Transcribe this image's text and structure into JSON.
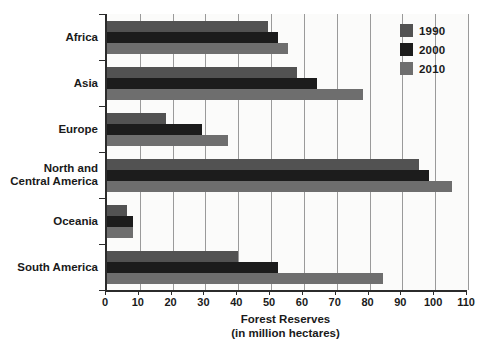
{
  "chart_data": {
    "type": "bar",
    "orientation": "horizontal",
    "title": "",
    "xlabel": "Forest Reserves (in million hectares)",
    "xlabel_line1": "Forest Reserves",
    "xlabel_line2": "(in million hectares)",
    "ylabel": "",
    "xlim": [
      0,
      110
    ],
    "xticks": [
      0,
      10,
      20,
      30,
      40,
      50,
      60,
      70,
      80,
      90,
      100,
      110
    ],
    "xtick_labels": [
      "0",
      "10",
      "20",
      "30",
      "40",
      "50",
      "60",
      "70",
      "80",
      "90",
      "100",
      "110"
    ],
    "grid": "vertical",
    "legend_position": "top-right",
    "categories": [
      "Africa",
      "Asia",
      "Europe",
      "North and Central America",
      "Oceania",
      "South America"
    ],
    "category_labels_wrapped": [
      [
        "Africa"
      ],
      [
        "Asia"
      ],
      [
        "Europe"
      ],
      [
        "North and",
        "Central America"
      ],
      [
        "Oceania"
      ],
      [
        "South America"
      ]
    ],
    "series": [
      {
        "name": "1990",
        "color": "#525252",
        "values": [
          49,
          58,
          18,
          95,
          6,
          40
        ]
      },
      {
        "name": "2000",
        "color": "#1c1c1c",
        "values": [
          52,
          64,
          29,
          98,
          8,
          52
        ]
      },
      {
        "name": "2010",
        "color": "#6e6e6e",
        "values": [
          55,
          78,
          37,
          105,
          8,
          84
        ]
      }
    ]
  },
  "legend": {
    "entries": [
      {
        "label": "1990",
        "color": "#525252"
      },
      {
        "label": "2000",
        "color": "#1c1c1c"
      },
      {
        "label": "2010",
        "color": "#6e6e6e"
      }
    ]
  },
  "colors": {
    "background": "#ffffff",
    "plot_background": "#fbfbfa",
    "axis": "#2b2b2b",
    "gridline": "#9a9a9a",
    "text": "#1a1a1a"
  }
}
